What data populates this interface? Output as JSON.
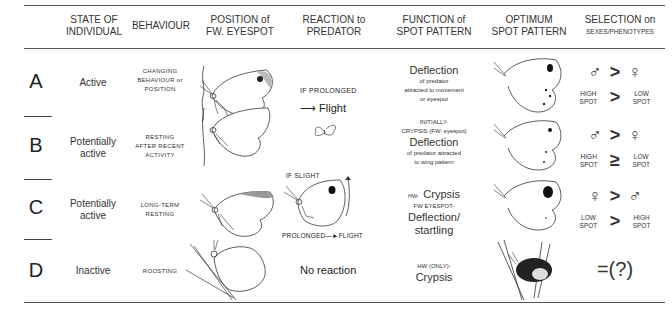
{
  "headers": {
    "state": [
      "STATE OF",
      "INDIVIDUAL"
    ],
    "behaviour": "BEHAVIOUR",
    "position": [
      "POSITION of",
      "FW. EYESPOT"
    ],
    "reaction": [
      "REACTION to",
      "PREDATOR"
    ],
    "function": [
      "FUNCTION of",
      "SPOT PATTERN"
    ],
    "optimum": [
      "OPTIMUM",
      "SPOT PATTERN"
    ],
    "selection": [
      "SELECTION on",
      "SEXES/PHENOTYPES"
    ]
  },
  "rows": [
    {
      "letter": "A",
      "state": [
        "Active"
      ],
      "behaviour": [
        "CHANGING",
        "BEHAVIOUR or",
        "POSITION"
      ],
      "reaction": {
        "condition": "IF PROLONGED",
        "outcome": "Flight"
      },
      "function": {
        "main": "Deflection",
        "lines": [
          "of predator",
          "attracted to movement",
          "or eyespot"
        ]
      },
      "selection": {
        "left_symbol": "male-symbol",
        "right_symbol": "female-symbol",
        "relation_top": ">",
        "left_label": [
          "HIGH",
          "SPOT"
        ],
        "relation_bottom": ">",
        "right_label": [
          "LOW",
          "SPOT"
        ]
      }
    },
    {
      "letter": "B",
      "state": [
        "Potentially",
        "active"
      ],
      "behaviour": [
        "RESTING",
        "AFTER RECENT",
        "ACTIVITY"
      ],
      "function": {
        "pre": [
          "INITIALLY-",
          "CRYPSIS (FW. eyespot)"
        ],
        "main": "Deflection",
        "lines": [
          "of predator attracted",
          "to wing pattern"
        ]
      },
      "selection": {
        "left_symbol": "male-symbol",
        "right_symbol": "female-symbol",
        "relation_top": ">",
        "left_label": [
          "HIGH",
          "SPOT"
        ],
        "relation_bottom": "≥",
        "right_label": [
          "LOW",
          "SPOT"
        ]
      }
    },
    {
      "letter": "C",
      "state": [
        "Potentially",
        "active"
      ],
      "behaviour": [
        "LONG-TERM",
        "RESTING"
      ],
      "reaction": {
        "condition": "IF SLIGHT",
        "outcome": "PROLONGED—►FLIGHT"
      },
      "function": {
        "hw_label": "HW-",
        "hw_main": "Crypsis",
        "fw_label": "FW EYESPOT-",
        "main": "Deflection/",
        "main2": "startling"
      },
      "selection": {
        "left_symbol": "female-symbol",
        "right_symbol": "male-symbol",
        "relation_top": ">",
        "left_label": [
          "LOW",
          "SPOT"
        ],
        "relation_bottom": ">",
        "right_label": [
          "HIGH",
          "SPOT"
        ]
      }
    },
    {
      "letter": "D",
      "state": [
        "Inactive"
      ],
      "behaviour": [
        "ROOSTING"
      ],
      "reaction": {
        "outcome": "No reaction"
      },
      "function": {
        "pre": [
          "HW (ONLY)-"
        ],
        "main": "Crypsis"
      },
      "selection": {
        "text": "=(?)"
      }
    }
  ],
  "symbols": {
    "male": "♂",
    "female": "♀"
  }
}
